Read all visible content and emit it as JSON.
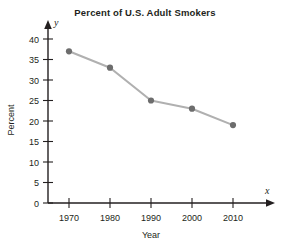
{
  "chart_data": {
    "type": "line",
    "title": "Percent of U.S. Adult Smokers",
    "xlabel": "Year",
    "ylabel": "Percent",
    "x_axis_variable": "x",
    "y_axis_variable": "y",
    "categories": [
      1970,
      1980,
      1990,
      2000,
      2010
    ],
    "x_tick_labels": [
      "1970",
      "1980",
      "1990",
      "2000",
      "2010"
    ],
    "values": [
      37,
      33,
      25,
      23,
      19
    ],
    "y_tick_labels": [
      "0",
      "5",
      "10",
      "15",
      "20",
      "25",
      "30",
      "35",
      "40"
    ],
    "y_ticks": [
      0,
      5,
      10,
      15,
      20,
      25,
      30,
      35,
      40
    ],
    "xlim": [
      1963,
      2022
    ],
    "ylim": [
      0,
      43
    ],
    "grid": false,
    "legend": null,
    "series": [
      {
        "name": "Percent of U.S. Adult Smokers",
        "values": [
          37,
          33,
          25,
          23,
          19
        ]
      }
    ],
    "colors": {
      "line": "#b0b0b0",
      "marker": "#6d6d6d",
      "axis": "#231f20",
      "background": "#ffffff"
    }
  }
}
